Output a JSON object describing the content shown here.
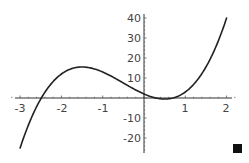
{
  "chart_data": {
    "type": "line",
    "title": "",
    "xlabel": "",
    "ylabel": "",
    "function": "4x^3 + 6x^2 - 9x + 2",
    "xlim": [
      -3,
      2
    ],
    "ylim": [
      -25,
      40
    ],
    "grid": false,
    "legend": null,
    "x_ticks": [
      -3,
      -2,
      -1,
      1,
      2
    ],
    "x_tick_labels": [
      "-3",
      "-2",
      "-1",
      "1",
      "2"
    ],
    "y_ticks": [
      -20,
      -10,
      10,
      20,
      30,
      40
    ],
    "y_tick_labels": [
      "-20",
      "-10",
      "10",
      "20",
      "30",
      "40"
    ],
    "series": [
      {
        "name": "f(x)",
        "x": [
          -3,
          -2.75,
          -2.5,
          -2.25,
          -2,
          -1.75,
          -1.5,
          -1.25,
          -1,
          -0.75,
          -0.5,
          -0.25,
          0,
          0.25,
          0.5,
          0.75,
          1,
          1.25,
          1.5,
          1.75,
          2
        ],
        "values": [
          -25,
          -12.59,
          -3.5,
          2.66,
          10,
          13.69,
          15.5,
          14.94,
          13,
          10.81,
          7.5,
          4.56,
          2,
          0.13,
          -0.5,
          0.19,
          3,
          7.81,
          15.5,
          26.94,
          40
        ]
      }
    ],
    "color": "#222222"
  },
  "marker": {
    "name": "end-of-output-square",
    "color": "#111111"
  }
}
